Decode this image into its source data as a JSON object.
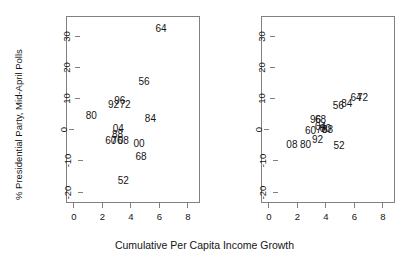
{
  "chart_data": [
    {
      "type": "scatter",
      "panel": "left",
      "title": "",
      "xlabel": "Cumulative Per Capita Income Growth",
      "ylabel": "% Presidential Party, Mid-April Polls",
      "xlim": [
        -0.55,
        8.85
      ],
      "ylim": [
        -23.5,
        36.5
      ],
      "xticks": [
        0,
        2,
        4,
        6,
        8
      ],
      "yticks": [
        -20,
        -10,
        0,
        10,
        20,
        30
      ],
      "grid": false,
      "legend": "none",
      "marker": "text-label",
      "points": [
        {
          "label": "64",
          "x": 6.05,
          "y": 32.5
        },
        {
          "label": "56",
          "x": 4.85,
          "y": 15.5
        },
        {
          "label": "96",
          "x": 3.15,
          "y": 9.6
        },
        {
          "label": "92",
          "x": 2.72,
          "y": 8.2
        },
        {
          "label": "72",
          "x": 3.52,
          "y": 8.2
        },
        {
          "label": "80",
          "x": 1.15,
          "y": 4.6
        },
        {
          "label": "84",
          "x": 5.3,
          "y": 3.9
        },
        {
          "label": "04",
          "x": 3.05,
          "y": 0.6
        },
        {
          "label": "88",
          "x": 3.0,
          "y": -1.5
        },
        {
          "label": "60",
          "x": 2.52,
          "y": -3.2
        },
        {
          "label": "76",
          "x": 2.95,
          "y": -3.2
        },
        {
          "label": "08",
          "x": 3.4,
          "y": -3.2
        },
        {
          "label": "00",
          "x": 4.5,
          "y": -4.4
        },
        {
          "label": "68",
          "x": 4.65,
          "y": -8.3
        },
        {
          "label": "52",
          "x": 3.4,
          "y": -16.2
        }
      ]
    },
    {
      "type": "scatter",
      "panel": "right",
      "title": "",
      "xlabel": "Cumulative Per Capita Income Growth",
      "ylabel": "% Presidential Party, Election Day Vote",
      "xlim": [
        -0.55,
        8.85
      ],
      "ylim": [
        -23.5,
        36.5
      ],
      "xticks": [
        0,
        2,
        4,
        6,
        8
      ],
      "yticks": [
        -20,
        -10,
        0,
        10,
        20,
        30
      ],
      "grid": false,
      "legend": "none",
      "marker": "text-label",
      "points": [
        {
          "label": "72",
          "x": 6.5,
          "y": 10.4
        },
        {
          "label": "64",
          "x": 6.05,
          "y": 10.4
        },
        {
          "label": "84",
          "x": 5.4,
          "y": 8.6
        },
        {
          "label": "56",
          "x": 4.8,
          "y": 7.8
        },
        {
          "label": "96",
          "x": 3.2,
          "y": 3.6
        },
        {
          "label": "68",
          "x": 3.55,
          "y": 3.3
        },
        {
          "label": "04",
          "x": 3.55,
          "y": 1.1
        },
        {
          "label": "00",
          "x": 3.9,
          "y": 0.6
        },
        {
          "label": "76",
          "x": 3.62,
          "y": 0.2
        },
        {
          "label": "88",
          "x": 4.05,
          "y": 0.2
        },
        {
          "label": "60",
          "x": 2.85,
          "y": 0.0
        },
        {
          "label": "92",
          "x": 3.35,
          "y": -3.1
        },
        {
          "label": "08",
          "x": 1.55,
          "y": -4.6
        },
        {
          "label": "80",
          "x": 2.5,
          "y": -4.6
        },
        {
          "label": "52",
          "x": 4.85,
          "y": -4.9
        }
      ]
    }
  ],
  "axes": {
    "shared_xlabel": "Cumulative Per Capita Income Growth",
    "left": {
      "ylabel": "% Presidential Party, Mid-April Polls",
      "xtick_labels": [
        "0",
        "2",
        "4",
        "6",
        "8"
      ],
      "ytick_labels": [
        "-20",
        "-10",
        "0",
        "10",
        "20",
        "30"
      ]
    },
    "right": {
      "ylabel": "% Presidential Party, Election Day Vote",
      "xtick_labels": [
        "0",
        "2",
        "4",
        "6",
        "8"
      ],
      "ytick_labels": [
        "-20",
        "-10",
        "0",
        "10",
        "20",
        "30"
      ]
    }
  },
  "colors": {
    "background": "#ffffff",
    "frame": "#808080",
    "text": "#141414"
  }
}
